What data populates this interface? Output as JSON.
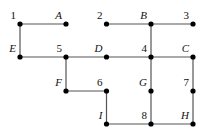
{
  "diagram": {
    "type": "grid-graph",
    "nodes": [
      {
        "id": "1",
        "label": "1",
        "italic": false,
        "col": 0,
        "row": 0
      },
      {
        "id": "A",
        "label": "A",
        "italic": true,
        "col": 1,
        "row": 0
      },
      {
        "id": "2",
        "label": "2",
        "italic": false,
        "col": 2,
        "row": 0
      },
      {
        "id": "B",
        "label": "B",
        "italic": true,
        "col": 3,
        "row": 0
      },
      {
        "id": "3",
        "label": "3",
        "italic": false,
        "col": 4,
        "row": 0
      },
      {
        "id": "E",
        "label": "E",
        "italic": true,
        "col": 0,
        "row": 1
      },
      {
        "id": "5",
        "label": "5",
        "italic": false,
        "col": 1,
        "row": 1
      },
      {
        "id": "D",
        "label": "D",
        "italic": true,
        "col": 2,
        "row": 1
      },
      {
        "id": "4",
        "label": "4",
        "italic": false,
        "col": 3,
        "row": 1
      },
      {
        "id": "C",
        "label": "C",
        "italic": true,
        "col": 4,
        "row": 1
      },
      {
        "id": "F",
        "label": "F",
        "italic": true,
        "col": 1,
        "row": 2
      },
      {
        "id": "6",
        "label": "6",
        "italic": false,
        "col": 2,
        "row": 2
      },
      {
        "id": "G",
        "label": "G",
        "italic": true,
        "col": 3,
        "row": 2
      },
      {
        "id": "7",
        "label": "7",
        "italic": false,
        "col": 4,
        "row": 2
      },
      {
        "id": "I",
        "label": "I",
        "italic": true,
        "col": 2,
        "row": 3
      },
      {
        "id": "8",
        "label": "8",
        "italic": false,
        "col": 3,
        "row": 3
      },
      {
        "id": "H",
        "label": "H",
        "italic": true,
        "col": 4,
        "row": 3
      }
    ],
    "edges": [
      [
        "1",
        "A"
      ],
      [
        "1",
        "E"
      ],
      [
        "E",
        "5"
      ],
      [
        "5",
        "D"
      ],
      [
        "D",
        "4"
      ],
      [
        "4",
        "C"
      ],
      [
        "2",
        "B"
      ],
      [
        "B",
        "3"
      ],
      [
        "B",
        "4"
      ],
      [
        "5",
        "F"
      ],
      [
        "F",
        "6"
      ],
      [
        "6",
        "I"
      ],
      [
        "I",
        "8"
      ],
      [
        "8",
        "H"
      ],
      [
        "4",
        "G"
      ],
      [
        "G",
        "8"
      ],
      [
        "C",
        "7"
      ],
      [
        "7",
        "H"
      ]
    ]
  }
}
